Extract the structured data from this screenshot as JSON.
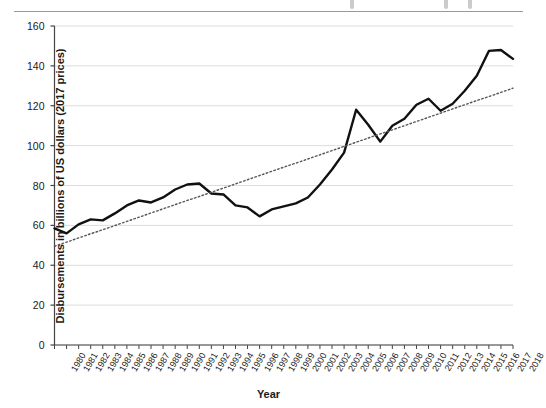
{
  "figure": {
    "background_color": "#ffffff",
    "rule_color": "#9a9a9a"
  },
  "axis_titles": {
    "y": "Disbursements in billions of US dollars (2017 prices)",
    "x": "Year"
  },
  "chart_data": {
    "type": "line",
    "title": "",
    "subtitle": "",
    "xlabel": "Year",
    "ylabel": "Disbursements in billions of US dollars (2017 prices)",
    "xlim": [
      1980,
      2018
    ],
    "ylim": [
      0,
      160
    ],
    "yticks": [
      0,
      20,
      40,
      60,
      80,
      100,
      120,
      140,
      160
    ],
    "ytick_labels": [
      "0",
      "20",
      "40",
      "60",
      "80",
      "100",
      "120",
      "140",
      "160"
    ],
    "grid": "horizontal",
    "legend": "none",
    "legend_position": "none",
    "categories": [
      "1980",
      "1981",
      "1982",
      "1983",
      "1984",
      "1985",
      "1986",
      "1987",
      "1988",
      "1989",
      "1990",
      "1991",
      "1992",
      "1993",
      "1994",
      "1995",
      "1996",
      "1997",
      "1998",
      "1999",
      "2000",
      "2001",
      "2002",
      "2003",
      "2004",
      "2005",
      "2006",
      "2007",
      "2008",
      "2009",
      "2010",
      "2011",
      "2012",
      "2013",
      "2014",
      "2015",
      "2016",
      "2017",
      "2018"
    ],
    "x": [
      1980,
      1981,
      1982,
      1983,
      1984,
      1985,
      1986,
      1987,
      1988,
      1989,
      1990,
      1991,
      1992,
      1993,
      1994,
      1995,
      1996,
      1997,
      1998,
      1999,
      2000,
      2001,
      2002,
      2003,
      2004,
      2005,
      2006,
      2007,
      2008,
      2009,
      2010,
      2011,
      2012,
      2013,
      2014,
      2015,
      2016,
      2017,
      2018
    ],
    "series": [
      {
        "name": "Disbursements",
        "style": "solid",
        "color": "#111111",
        "line_width": 2.4,
        "values": [
          58.5,
          56.0,
          60.5,
          63.0,
          62.5,
          66.0,
          70.0,
          72.5,
          71.5,
          74.0,
          78.0,
          80.5,
          81.0,
          76.0,
          75.5,
          70.0,
          69.0,
          64.5,
          68.0,
          69.5,
          71.0,
          74.0,
          80.5,
          88.0,
          96.5,
          118.0,
          110.5,
          102.0,
          110.0,
          113.5,
          120.5,
          123.5,
          117.5,
          121.0,
          127.5,
          135.0,
          147.5,
          148.0,
          143.5
        ]
      },
      {
        "name": "Linear trend",
        "style": "dotted",
        "color": "#555555",
        "line_width": 1.4,
        "values": [
          49.5,
          51.6,
          53.7,
          55.8,
          57.8,
          59.9,
          62.0,
          64.1,
          66.2,
          68.3,
          70.4,
          72.5,
          74.5,
          76.6,
          78.7,
          80.8,
          82.9,
          85.0,
          87.1,
          89.2,
          91.2,
          93.3,
          95.4,
          97.5,
          99.6,
          101.7,
          103.8,
          105.9,
          107.9,
          110.0,
          112.1,
          114.2,
          116.3,
          118.4,
          120.5,
          122.6,
          124.6,
          126.7,
          128.8
        ]
      }
    ]
  }
}
